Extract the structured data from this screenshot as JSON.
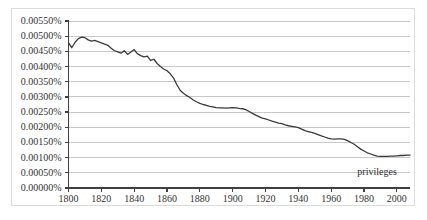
{
  "chart_data": {
    "type": "line",
    "title": "",
    "subtitle": "",
    "xlabel": "",
    "ylabel": "",
    "xlim": [
      1800,
      2008
    ],
    "ylim": [
      0.0,
      0.0055
    ],
    "grid": true,
    "grid_orientation": "horizontal",
    "legend": "inline-annotation",
    "legend_position": "bottom-right",
    "y_tick_labels": [
      "0.00550%",
      "0.00500%",
      "0.00450%",
      "0.00400%",
      "0.00350%",
      "0.00300%",
      "0.00250%",
      "0.00200%",
      "0.00150%",
      "0.00100%",
      "0.00050%",
      "0.00000%"
    ],
    "y_tick_values": [
      0.0055,
      0.005,
      0.0045,
      0.004,
      0.0035,
      0.003,
      0.0025,
      0.002,
      0.0015,
      0.001,
      0.0005,
      0.0
    ],
    "x_tick_labels": [
      "1800",
      "1820",
      "1840",
      "1860",
      "1880",
      "1900",
      "1920",
      "1940",
      "1960",
      "1980",
      "2000"
    ],
    "x_tick_values": [
      1800,
      1820,
      1840,
      1860,
      1880,
      1900,
      1920,
      1940,
      1960,
      1980,
      2000
    ],
    "annotations": [
      {
        "text": "privileges",
        "x": 1993,
        "y": 0.00052
      }
    ],
    "series": [
      {
        "name": "privileges",
        "color": "#3a3a3a",
        "x": [
          1800,
          1802,
          1804,
          1806,
          1808,
          1810,
          1812,
          1814,
          1816,
          1818,
          1820,
          1822,
          1824,
          1826,
          1828,
          1830,
          1832,
          1834,
          1836,
          1838,
          1840,
          1842,
          1844,
          1846,
          1848,
          1850,
          1852,
          1854,
          1856,
          1858,
          1860,
          1862,
          1864,
          1866,
          1868,
          1870,
          1872,
          1874,
          1876,
          1878,
          1880,
          1882,
          1884,
          1886,
          1888,
          1890,
          1892,
          1894,
          1896,
          1898,
          1900,
          1902,
          1904,
          1906,
          1908,
          1910,
          1912,
          1914,
          1916,
          1918,
          1920,
          1922,
          1924,
          1926,
          1928,
          1930,
          1932,
          1934,
          1936,
          1938,
          1940,
          1942,
          1944,
          1946,
          1948,
          1950,
          1952,
          1954,
          1956,
          1958,
          1960,
          1962,
          1964,
          1966,
          1968,
          1970,
          1972,
          1974,
          1976,
          1978,
          1980,
          1982,
          1984,
          1986,
          1988,
          1990,
          1992,
          1994,
          1996,
          1998,
          2000,
          2002,
          2004,
          2006,
          2008
        ],
        "values": [
          0.00478,
          0.00462,
          0.0048,
          0.00492,
          0.00497,
          0.00495,
          0.00488,
          0.00484,
          0.00486,
          0.00482,
          0.00478,
          0.00474,
          0.0047,
          0.0046,
          0.00452,
          0.00448,
          0.00444,
          0.00452,
          0.0044,
          0.00448,
          0.00456,
          0.00442,
          0.00436,
          0.00432,
          0.00434,
          0.0042,
          0.00424,
          0.0041,
          0.004,
          0.00392,
          0.00386,
          0.00376,
          0.00362,
          0.0034,
          0.00322,
          0.00312,
          0.00304,
          0.00298,
          0.0029,
          0.00284,
          0.00279,
          0.00275,
          0.00272,
          0.00269,
          0.00267,
          0.00265,
          0.00264,
          0.00264,
          0.00263,
          0.00264,
          0.00265,
          0.00264,
          0.00262,
          0.00261,
          0.00258,
          0.00252,
          0.00246,
          0.0024,
          0.00235,
          0.0023,
          0.00228,
          0.00224,
          0.0022,
          0.00217,
          0.00214,
          0.00212,
          0.00208,
          0.00205,
          0.00203,
          0.00201,
          0.00199,
          0.00194,
          0.00189,
          0.00186,
          0.00183,
          0.0018,
          0.00176,
          0.00172,
          0.00168,
          0.00164,
          0.00162,
          0.00161,
          0.00162,
          0.00162,
          0.0016,
          0.00156,
          0.0015,
          0.00144,
          0.00136,
          0.00128,
          0.00122,
          0.00116,
          0.00112,
          0.00108,
          0.00105,
          0.00104,
          0.00104,
          0.00104,
          0.00105,
          0.00105,
          0.00106,
          0.00107,
          0.00107,
          0.00108,
          0.00108
        ]
      }
    ]
  },
  "style": {
    "background_color": "#ffffff",
    "frame_color": "#dcdcdc",
    "gridline_color": "#c8c8c8",
    "axis_color": "#404040",
    "line_color": "#3a3a3a",
    "text_color": "#333333"
  }
}
